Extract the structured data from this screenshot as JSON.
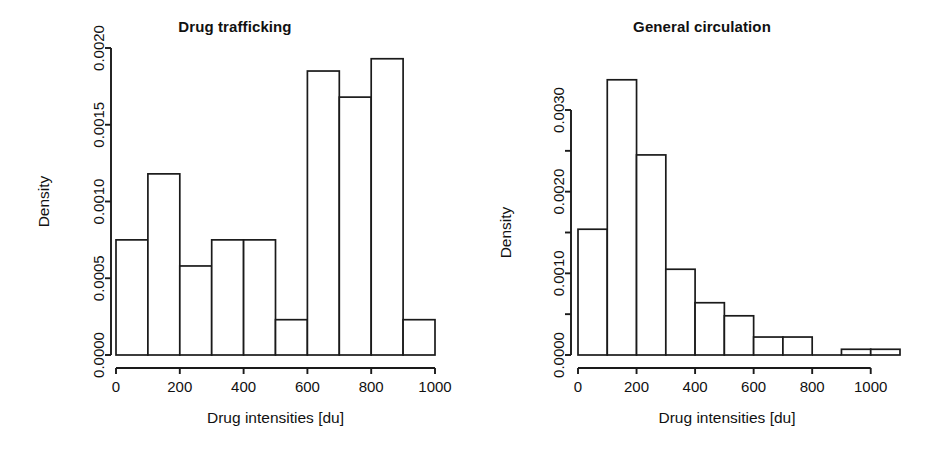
{
  "figure": {
    "background": "#ffffff",
    "ink_color": "#1a1a1a"
  },
  "panels": [
    {
      "id": "drug-trafficking",
      "title": "Drug trafficking",
      "xlabel": "Drug intensities [du]",
      "ylabel": "Density",
      "xticks": [
        "0",
        "200",
        "400",
        "600",
        "800",
        "1000"
      ],
      "yticks": [
        "0.0000",
        "0.0005",
        "0.0010",
        "0.0015",
        "0.0020"
      ]
    },
    {
      "id": "general-circulation",
      "title": "General circulation",
      "xlabel": "Drug intensities [du]",
      "ylabel": "Density",
      "xticks": [
        "0",
        "200",
        "400",
        "600",
        "800",
        "1000"
      ],
      "yticks": [
        "0.0000",
        "0.0010",
        "0.0020",
        "0.0030"
      ]
    }
  ],
  "chart_data": [
    {
      "type": "bar",
      "subtype": "histogram",
      "title": "Drug trafficking",
      "xlabel": "Drug intensities [du]",
      "ylabel": "Density",
      "bin_width": 100,
      "bin_edges": [
        0,
        100,
        200,
        300,
        400,
        500,
        600,
        700,
        800,
        900,
        1000
      ],
      "categories": [
        "0-100",
        "100-200",
        "200-300",
        "300-400",
        "400-500",
        "500-600",
        "600-700",
        "700-800",
        "800-900",
        "900-1000"
      ],
      "values": [
        0.00075,
        0.00118,
        0.00058,
        0.00075,
        0.00075,
        0.00023,
        0.00185,
        0.00168,
        0.00193,
        0.00023
      ],
      "xlim": [
        0,
        1000
      ],
      "ylim": [
        0,
        0.0021
      ],
      "xticks": [
        0,
        200,
        400,
        600,
        800,
        1000
      ],
      "xtick_labels": [
        "0",
        "200",
        "400",
        "600",
        "800",
        "1000"
      ],
      "yticks": [
        0.0,
        0.0005,
        0.001,
        0.0015,
        0.002
      ],
      "ytick_labels": [
        "0.0000",
        "0.0005",
        "0.0010",
        "0.0015",
        "0.0020"
      ],
      "grid": false,
      "legend": false,
      "bar_fill": "#ffffff",
      "bar_edge": "#1a1a1a"
    },
    {
      "type": "bar",
      "subtype": "histogram",
      "title": "General circulation",
      "xlabel": "Drug intensities [du]",
      "ylabel": "Density",
      "bin_width": 100,
      "bin_edges": [
        0,
        100,
        200,
        300,
        400,
        500,
        600,
        700,
        800,
        900,
        1000,
        1100
      ],
      "categories": [
        "0-100",
        "100-200",
        "200-300",
        "300-400",
        "400-500",
        "500-600",
        "600-700",
        "700-800",
        "800-900",
        "900-1000",
        "1000-1100"
      ],
      "values": [
        0.00154,
        0.00337,
        0.00245,
        0.00105,
        0.00064,
        0.00048,
        0.00022,
        0.00022,
        0.0,
        7e-05,
        7e-05
      ],
      "xlim": [
        0,
        1100
      ],
      "ylim": [
        0,
        0.0034
      ],
      "xticks": [
        0,
        200,
        400,
        600,
        800,
        1000
      ],
      "xtick_labels": [
        "0",
        "200",
        "400",
        "600",
        "800",
        "1000"
      ],
      "yticks": [
        0.0,
        0.001,
        0.002,
        0.003
      ],
      "ytick_labels": [
        "0.0000",
        "0.0010",
        "0.0020",
        "0.0030"
      ],
      "yticks_minor": [
        0.0005,
        0.0015,
        0.0025
      ],
      "grid": false,
      "legend": false,
      "bar_fill": "#ffffff",
      "bar_edge": "#1a1a1a"
    }
  ]
}
